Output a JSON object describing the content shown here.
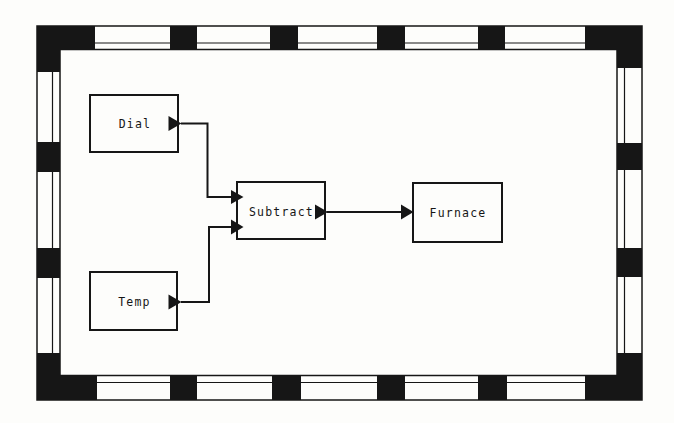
{
  "figure": {
    "type": "dataflow-block-diagram"
  },
  "theme": {
    "ink": "#161616",
    "paper": "#fdfdfb"
  },
  "nodes": [
    {
      "id": "dial",
      "label": "Dial"
    },
    {
      "id": "temp",
      "label": "Temp"
    },
    {
      "id": "subtract",
      "label": "Subtract"
    },
    {
      "id": "furnace",
      "label": "Furnace"
    }
  ],
  "connections": [
    {
      "from": "dial",
      "to": "subtract"
    },
    {
      "from": "temp",
      "to": "subtract"
    },
    {
      "from": "subtract",
      "to": "furnace"
    }
  ]
}
